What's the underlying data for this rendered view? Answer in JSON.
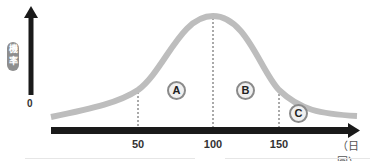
{
  "diagram": {
    "type": "probability-distribution",
    "y_axis": {
      "label": "機率",
      "origin_label": "0"
    },
    "x_axis": {
      "ticks": [
        "50",
        "100",
        "150"
      ],
      "unit_label": "（日圓）"
    },
    "regions": [
      {
        "id": "A",
        "label": "A"
      },
      {
        "id": "B",
        "label": "B"
      },
      {
        "id": "C",
        "label": "C"
      }
    ],
    "colors": {
      "curve": "#bdbdbd",
      "axis": "#1a1a1a",
      "region_border": "#8a8a8a",
      "label_pill": "#8e8e8e"
    }
  }
}
